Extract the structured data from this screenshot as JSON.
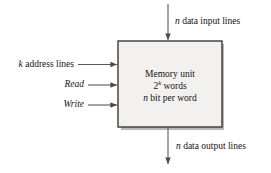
{
  "diagram": {
    "block": {
      "line1": "Memory unit",
      "line2_base": "2",
      "line2_exp": "k",
      "line2_tail": " words",
      "line3_var": "n",
      "line3_tail": " bit per word",
      "fill_color": "#f2f1ef",
      "border_color": "#3a3a3a"
    },
    "inputs": {
      "data_in": {
        "var": "n",
        "text": " data input lines"
      },
      "address": {
        "var": "k",
        "text": " address lines"
      },
      "read": {
        "label": "Read"
      },
      "write": {
        "label": "Write"
      }
    },
    "outputs": {
      "data_out": {
        "var": "n",
        "text": " data output lines"
      }
    },
    "line_color": "#595959"
  }
}
